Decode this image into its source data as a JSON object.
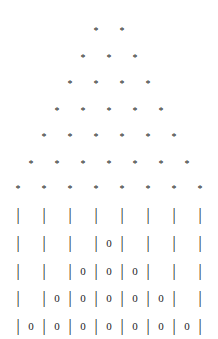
{
  "figure": {
    "background_color": "#ffffff",
    "foreground_color": "#1a1a1a",
    "columns": 8
  },
  "star_section": {
    "glyph": "*",
    "rows": [
      {
        "count": 2,
        "top": 22,
        "label": "star-row-1"
      },
      {
        "count": 3,
        "top": 49,
        "label": "star-row-2"
      },
      {
        "count": 4,
        "top": 75,
        "label": "star-row-3"
      },
      {
        "count": 5,
        "top": 102,
        "label": "star-row-4"
      },
      {
        "count": 6,
        "top": 128,
        "label": "star-row-5"
      },
      {
        "count": 7,
        "top": 155,
        "label": "star-row-6"
      },
      {
        "count": 8,
        "top": 180,
        "label": "star-row-7"
      }
    ]
  },
  "bar_section": {
    "pipe_glyph": "|",
    "zero_glyph": "0",
    "blank_glyph": " ",
    "rows": [
      {
        "label": "bar-row-1",
        "top": 207,
        "zeros": 0,
        "cells": [
          "|",
          " ",
          "|",
          " ",
          "|",
          " ",
          "|",
          " ",
          "|",
          " ",
          "|",
          " ",
          "|",
          " ",
          "|"
        ]
      },
      {
        "label": "bar-row-2",
        "top": 235,
        "zeros": 1,
        "cells": [
          "|",
          " ",
          "|",
          " ",
          "|",
          " ",
          "|",
          "0",
          "|",
          " ",
          "|",
          " ",
          "|",
          " ",
          "|"
        ]
      },
      {
        "label": "bar-row-3",
        "top": 263,
        "zeros": 3,
        "cells": [
          "|",
          " ",
          "|",
          " ",
          "|",
          "0",
          "|",
          "0",
          "|",
          "0",
          "|",
          " ",
          "|",
          " ",
          "|"
        ]
      },
      {
        "label": "bar-row-4",
        "top": 290,
        "zeros": 5,
        "cells": [
          "|",
          " ",
          "|",
          "0",
          "|",
          "0",
          "|",
          "0",
          "|",
          "0",
          "|",
          "0",
          "|",
          " ",
          "|"
        ]
      },
      {
        "label": "bar-row-5",
        "top": 318,
        "zeros": 7,
        "cells": [
          "|",
          "0",
          "|",
          "0",
          "|",
          "0",
          "|",
          "0",
          "|",
          "0",
          "|",
          "0",
          "|",
          "0",
          "|"
        ]
      }
    ]
  }
}
